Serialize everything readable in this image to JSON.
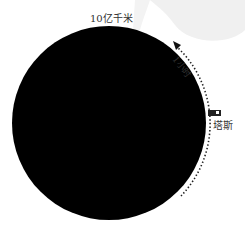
{
  "diagram": {
    "scale_label": "10亿千米",
    "time_label": "1小时",
    "object_label": "塔斯",
    "colors": {
      "body": "#000000",
      "background_shape": "#f0f0f0",
      "dots": "#222222",
      "marker": "#222222"
    }
  }
}
